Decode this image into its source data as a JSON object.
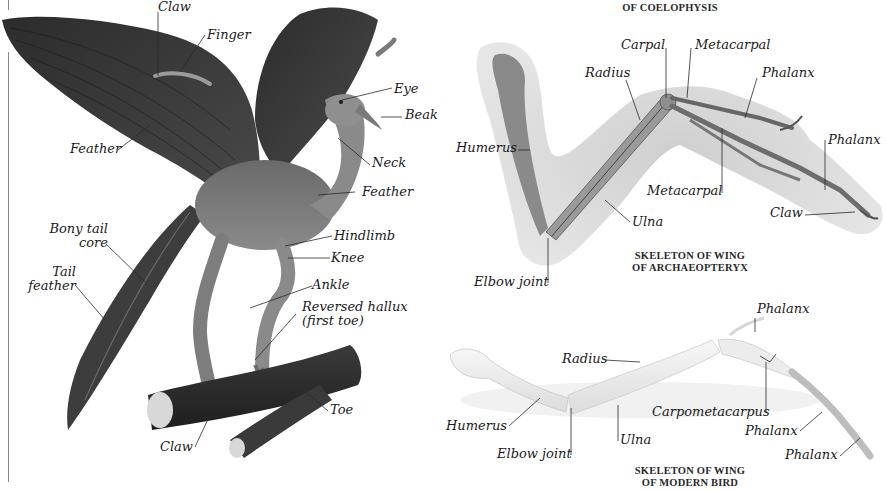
{
  "figure_left": {
    "subject": "Archaeopteryx model perched on branch",
    "labels": {
      "claw_top": "Claw",
      "finger": "Finger",
      "feather_wing": "Feather",
      "eye": "Eye",
      "beak": "Beak",
      "neck": "Neck",
      "feather_body": "Feather",
      "bony_tail_core_1": "Bony tail",
      "bony_tail_core_2": "core",
      "tail_feather_1": "Tail",
      "tail_feather_2": "feather",
      "hindlimb": "Hindlimb",
      "knee": "Knee",
      "ankle": "Ankle",
      "reversed_hallux_1": "Reversed hallux",
      "reversed_hallux_2": "(first toe)",
      "toe": "Toe",
      "claw_bottom": "Claw"
    }
  },
  "figure_archaeopteryx_wing": {
    "caption_top_fragment": "OF COELOPHYSIS",
    "caption_line1": "SKELETON OF WING",
    "caption_line2": "OF ARCHAEOPTERYX",
    "labels": {
      "carpal": "Carpal",
      "metacarpal_top": "Metacarpal",
      "radius": "Radius",
      "phalanx_1": "Phalanx",
      "humerus": "Humerus",
      "phalanx_2": "Phalanx",
      "metacarpal_bottom": "Metacarpal",
      "claw": "Claw",
      "ulna": "Ulna",
      "elbow_joint": "Elbow joint"
    }
  },
  "figure_modern_wing": {
    "caption_line1": "SKELETON OF WING",
    "caption_line2": "OF MODERN BIRD",
    "labels": {
      "phalanx_top": "Phalanx",
      "radius": "Radius",
      "carpometacarpus": "Carpometacarpus",
      "humerus": "Humerus",
      "ulna": "Ulna",
      "phalanx_mid": "Phalanx",
      "elbow_joint": "Elbow joint",
      "phalanx_bottom": "Phalanx"
    }
  },
  "colors": {
    "background": "#ffffff",
    "label_text": "#1a1a1a",
    "leader_line": "#2a2a2a",
    "bird_dark": "#3a3a3a",
    "fossil_halo": "#c9c9c9",
    "bone_light": "#eeeeee"
  }
}
